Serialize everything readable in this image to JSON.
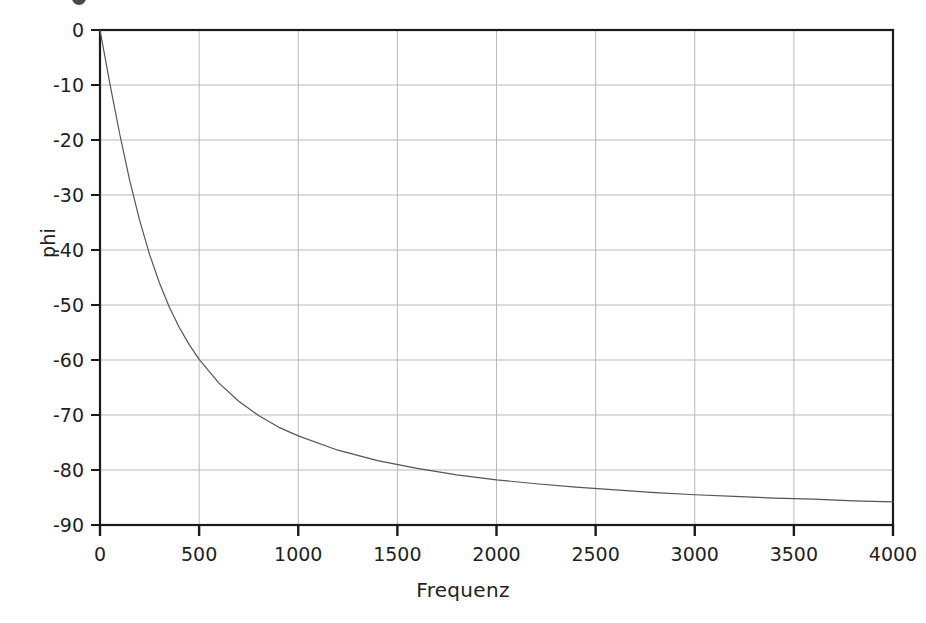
{
  "figure": {
    "title": "",
    "background_color": "#ffffff",
    "clipped_glyph_above": true
  },
  "chart_data": {
    "type": "line",
    "title": "",
    "subtitle": "",
    "xlabel": "Frequenz",
    "ylabel": "phi",
    "xlim": [
      0,
      4000
    ],
    "ylim": [
      -90,
      0
    ],
    "xticks": [
      0,
      500,
      1000,
      1500,
      2000,
      2500,
      3000,
      3500,
      4000
    ],
    "xtick_labels": [
      "0",
      "500",
      "1000",
      "1500",
      "2000",
      "2500",
      "3000",
      "3500",
      "4000"
    ],
    "yticks": [
      0,
      -10,
      -20,
      -30,
      -40,
      -50,
      -60,
      -70,
      -80,
      -90
    ],
    "ytick_labels": [
      "0",
      "-10",
      "-20",
      "-30",
      "-40",
      "-50",
      "-60",
      "-70",
      "-80",
      "-90"
    ],
    "grid": true,
    "grid_color": "#b9b9b9",
    "axis_color": "#1a1a1a",
    "legend": null,
    "legend_position": "none",
    "annotations": [],
    "series": [
      {
        "name": "phi(f)",
        "color": "#555555",
        "line_width": 1.2,
        "marker": "none",
        "description": "Phase angle of a first-order low-pass, phi = -arctan(f / f_c), corner frequency about 290 Hz",
        "corner_frequency": 290,
        "x": [
          0,
          50,
          100,
          150,
          200,
          250,
          300,
          350,
          400,
          450,
          500,
          600,
          700,
          800,
          900,
          1000,
          1200,
          1400,
          1600,
          1800,
          2000,
          2200,
          2400,
          2600,
          2800,
          3000,
          3200,
          3400,
          3600,
          3800,
          4000
        ],
        "y": [
          0,
          -9.8,
          -19.0,
          -27.4,
          -34.6,
          -40.8,
          -46.0,
          -50.4,
          -54.1,
          -57.2,
          -59.9,
          -64.2,
          -67.5,
          -70.1,
          -72.2,
          -73.8,
          -76.4,
          -78.3,
          -79.7,
          -80.9,
          -81.8,
          -82.5,
          -83.1,
          -83.6,
          -84.1,
          -84.5,
          -84.8,
          -85.1,
          -85.3,
          -85.6,
          -85.8
        ]
      }
    ]
  },
  "axes": {
    "y_axis_label": "phi",
    "x_axis_label": "Frequenz"
  }
}
